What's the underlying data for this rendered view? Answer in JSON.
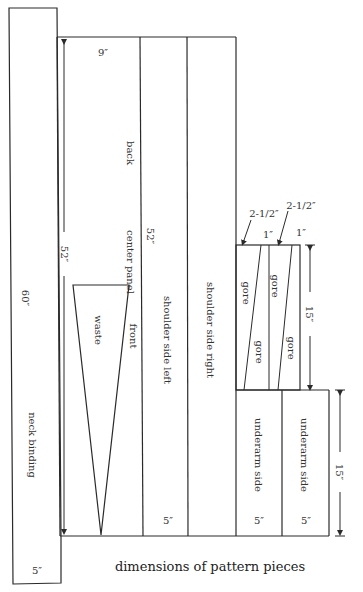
{
  "diagram": {
    "caption": "dimensions of pattern pieces",
    "pieces": {
      "neck_binding": {
        "name": "neck binding",
        "length": "60″",
        "width": "5″"
      },
      "center_panel": {
        "name": "center panel",
        "top_label": "back",
        "bottom_label": "front",
        "width": "9″",
        "length": "52″"
      },
      "waste": {
        "name": "waste"
      },
      "shoulder_side_left": {
        "name": "shoulder side left",
        "width": "5″"
      },
      "shoulder_side_right": {
        "name": "shoulder side right"
      },
      "gores": {
        "name": "gore",
        "length": "15″",
        "top_narrow": "1″",
        "top_wide": "2-1/2″"
      },
      "underarm_side_left": {
        "name": "underarm side",
        "width": "5″"
      },
      "underarm_side_right": {
        "name": "underarm side",
        "width": "5″",
        "length": "15″"
      }
    },
    "dimension_labels": {
      "main_length": "52″",
      "gore_wide_1": "2-1/2″",
      "gore_wide_2": "2-1/2″",
      "gore_narrow_1": "1″",
      "gore_narrow_2": "1″",
      "gore_length": "15″",
      "underarm_length": "15″"
    }
  }
}
